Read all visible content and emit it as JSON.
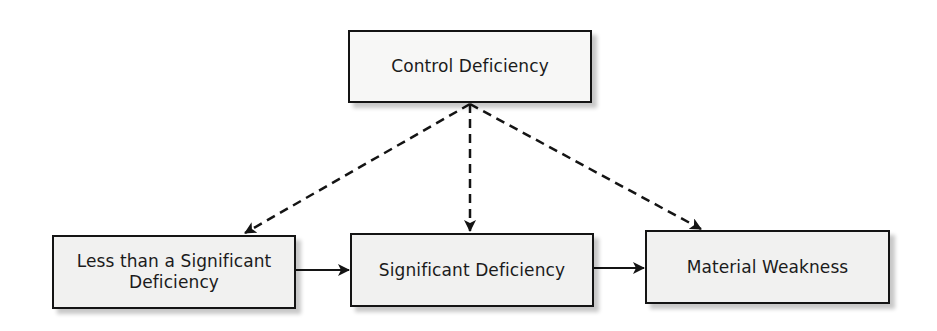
{
  "diagram": {
    "top_node": {
      "label": "Control Deficiency"
    },
    "bottom_nodes": [
      {
        "label": "Less than a Significant Deficiency",
        "line1": "Less than a Significant",
        "line2": "Deficiency"
      },
      {
        "label": "Significant Deficiency"
      },
      {
        "label": "Material Weakness"
      }
    ],
    "edges": [
      {
        "from": "Control Deficiency",
        "to": "Less than a Significant Deficiency",
        "style": "dashed"
      },
      {
        "from": "Control Deficiency",
        "to": "Significant Deficiency",
        "style": "dashed"
      },
      {
        "from": "Control Deficiency",
        "to": "Material Weakness",
        "style": "dashed"
      },
      {
        "from": "Less than a Significant Deficiency",
        "to": "Significant Deficiency",
        "style": "solid"
      },
      {
        "from": "Significant Deficiency",
        "to": "Material Weakness",
        "style": "solid"
      }
    ],
    "colors": {
      "border": "#141414",
      "box_fill": "#f1f1f0",
      "text": "#1b1b1b",
      "background": "#ffffff"
    }
  }
}
